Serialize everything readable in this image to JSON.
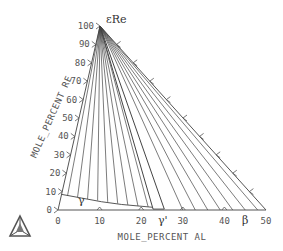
{
  "diagram": {
    "type": "ternary-isothermal-section",
    "components": [
      "Ni",
      "Al",
      "Re"
    ],
    "bottom_axis": {
      "title": "MOLE_PERCENT AL",
      "ticks": [
        0,
        10,
        20,
        30,
        40,
        50
      ],
      "tick_labels": [
        "0",
        "10",
        "20",
        "30",
        "40",
        "50"
      ]
    },
    "left_axis": {
      "title": "MOLE_PERCENT RE",
      "ticks": [
        0,
        10,
        20,
        30,
        40,
        50,
        60,
        70,
        80,
        90,
        100
      ],
      "tick_labels": [
        "0",
        "10",
        "20",
        "30",
        "40",
        "50",
        "60",
        "70",
        "80",
        "90",
        "100"
      ]
    },
    "phase_labels": {
      "apex": "εRe",
      "gamma": "γ",
      "gamma_prime": "γ'",
      "beta": "β"
    },
    "gamma_boundary": [
      [
        0,
        8.5
      ],
      [
        5,
        6.5
      ],
      [
        10,
        4.5
      ],
      [
        15,
        3
      ],
      [
        20,
        2
      ],
      [
        22.5,
        1.5
      ]
    ],
    "gamma_prime_boundary": [
      [
        22.8,
        0.5
      ],
      [
        25.5,
        0.5
      ]
    ],
    "beta_start": 26,
    "tie_lines_gamma_al": [
      1.5,
      4,
      6.5,
      9,
      11.5,
      14,
      16.5,
      19,
      21.5
    ],
    "tie_lines_gamma_re": [
      7.8,
      6.9,
      6,
      5.2,
      4.4,
      3.5,
      2.8,
      2.2,
      1.7
    ],
    "tie_lines_gammaprime_al": [
      22.8,
      25.5
    ],
    "tie_lines_beta_al": [
      30,
      33,
      36,
      39,
      42,
      45,
      48
    ]
  }
}
